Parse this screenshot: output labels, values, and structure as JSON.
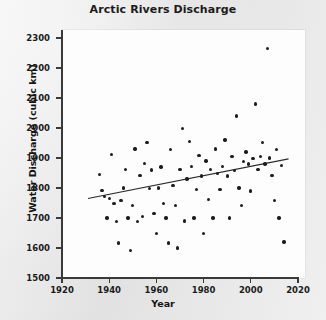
{
  "chart_data": {
    "type": "scatter",
    "title": "Arctic Rivers Discharge",
    "xlabel": "Year",
    "ylabel": "Water Discharge (cubic km)",
    "xlim": [
      1920,
      2020
    ],
    "ylim": [
      1500,
      2300
    ],
    "xticks": [
      1920,
      1940,
      1960,
      1980,
      2000,
      2020
    ],
    "yticks": [
      1500,
      1600,
      1700,
      1800,
      1900,
      2000,
      2100,
      2200,
      2300
    ],
    "grid": false,
    "legend": null,
    "marker": "filled-circle",
    "marker_color": "#1d1d1d",
    "series": [
      {
        "name": "Annual discharge",
        "points": [
          [
            1936,
            1845
          ],
          [
            1937,
            1792
          ],
          [
            1938,
            1772
          ],
          [
            1939,
            1700
          ],
          [
            1940,
            1765
          ],
          [
            1941,
            1912
          ],
          [
            1942,
            1748
          ],
          [
            1943,
            1689
          ],
          [
            1944,
            1617
          ],
          [
            1945,
            1758
          ],
          [
            1946,
            1800
          ],
          [
            1947,
            1862
          ],
          [
            1948,
            1700
          ],
          [
            1949,
            1592
          ],
          [
            1950,
            1742
          ],
          [
            1951,
            1930
          ],
          [
            1952,
            1688
          ],
          [
            1953,
            1842
          ],
          [
            1954,
            1706
          ],
          [
            1955,
            1882
          ],
          [
            1956,
            1952
          ],
          [
            1957,
            1798
          ],
          [
            1958,
            1860
          ],
          [
            1959,
            1716
          ],
          [
            1960,
            1648
          ],
          [
            1961,
            1800
          ],
          [
            1962,
            1870
          ],
          [
            1963,
            1748
          ],
          [
            1964,
            1700
          ],
          [
            1965,
            1617
          ],
          [
            1966,
            1928
          ],
          [
            1967,
            1808
          ],
          [
            1968,
            1742
          ],
          [
            1969,
            1600
          ],
          [
            1970,
            1862
          ],
          [
            1971,
            1998
          ],
          [
            1972,
            1690
          ],
          [
            1973,
            1830
          ],
          [
            1974,
            1955
          ],
          [
            1975,
            1872
          ],
          [
            1976,
            1700
          ],
          [
            1977,
            1795
          ],
          [
            1978,
            1908
          ],
          [
            1979,
            1840
          ],
          [
            1980,
            1648
          ],
          [
            1981,
            1890
          ],
          [
            1982,
            1762
          ],
          [
            1983,
            1862
          ],
          [
            1984,
            1700
          ],
          [
            1985,
            1930
          ],
          [
            1986,
            1848
          ],
          [
            1987,
            1795
          ],
          [
            1988,
            1872
          ],
          [
            1989,
            1960
          ],
          [
            1990,
            1840
          ],
          [
            1991,
            1700
          ],
          [
            1992,
            1905
          ],
          [
            1993,
            1858
          ],
          [
            1994,
            2040
          ],
          [
            1995,
            1800
          ],
          [
            1996,
            1742
          ],
          [
            1997,
            1888
          ],
          [
            1998,
            1920
          ],
          [
            1999,
            1880
          ],
          [
            2000,
            1790
          ],
          [
            2001,
            1898
          ],
          [
            2002,
            2080
          ],
          [
            2003,
            1862
          ],
          [
            2004,
            1905
          ],
          [
            2005,
            1952
          ],
          [
            2006,
            1880
          ],
          [
            2007,
            2265
          ],
          [
            2008,
            1900
          ],
          [
            2009,
            1842
          ],
          [
            2010,
            1758
          ],
          [
            2011,
            1928
          ],
          [
            2012,
            1700
          ],
          [
            2013,
            1875
          ],
          [
            2014,
            1620
          ]
        ]
      }
    ],
    "trend_line": {
      "name": "linear fit",
      "x_start": 1931,
      "y_start": 1765,
      "x_end": 2016,
      "y_end": 1897,
      "color": "#2a2a2a"
    }
  }
}
